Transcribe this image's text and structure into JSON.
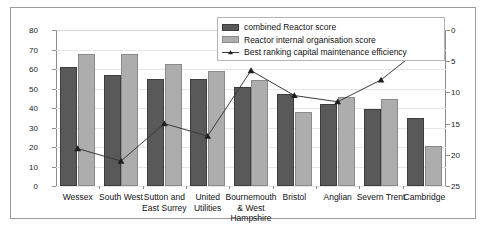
{
  "chart_data": {
    "type": "bar",
    "title": "",
    "xlabel": "",
    "ylabel": "",
    "categories": [
      "Wessex",
      "South West",
      "Sutton and East Surrey",
      "United Utilities",
      "Bournemouth & West Hampshire",
      "Bristol",
      "Anglian",
      "Severn Trent",
      "Cambridge"
    ],
    "left_axis": {
      "min": 0,
      "max": 80,
      "step": 10,
      "ticks": [
        0,
        10,
        20,
        30,
        40,
        50,
        60,
        70,
        80
      ],
      "inverted": false
    },
    "right_axis": {
      "min": 0,
      "max": 25,
      "step": 5,
      "ticks": [
        0,
        5,
        10,
        15,
        20,
        25
      ],
      "inverted": true
    },
    "grid": true,
    "legend_position": "top-right",
    "series": [
      {
        "name": "combined Reactor score",
        "type": "bar",
        "axis": "left",
        "color": "#595959",
        "values": [
          61,
          57,
          55,
          55,
          51,
          47,
          42,
          39.5,
          35
        ]
      },
      {
        "name": "Reactor internal organisation score",
        "type": "bar",
        "axis": "left",
        "color": "#adadad",
        "values": [
          67.5,
          67.5,
          62.5,
          59,
          54.5,
          38,
          45.5,
          44.5,
          20.5
        ]
      },
      {
        "name": "Best ranking capital maintenance efficiency",
        "type": "line",
        "axis": "right",
        "color": "#3a3a3a",
        "values": [
          19,
          21,
          15,
          17,
          6.5,
          10.5,
          11.5,
          8,
          2.5
        ]
      }
    ]
  },
  "legend": {
    "items": [
      {
        "label": "combined Reactor score"
      },
      {
        "label": "Reactor internal organisation score"
      },
      {
        "label": "Best ranking capital maintenance efficiency"
      }
    ]
  },
  "colors": {
    "bar_dark": "#595959",
    "bar_light": "#adadad",
    "line": "#3a3a3a",
    "frame": "#9a9a9a",
    "grid": "#e6e6e6"
  }
}
